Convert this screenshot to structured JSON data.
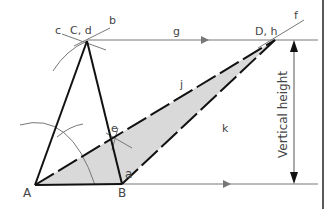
{
  "diagram": {
    "title": "",
    "points": {
      "A": {
        "label": "A",
        "x": 35,
        "y": 185
      },
      "B": {
        "label": "B",
        "x": 122,
        "y": 184
      },
      "C": {
        "label": "C, d",
        "x": 87,
        "y": 41
      },
      "D": {
        "label": "D, h",
        "x": 275,
        "y": 40
      }
    },
    "labels": {
      "a": "a",
      "b": "b",
      "c": "c",
      "e": "e",
      "f": "f",
      "g": "g",
      "j": "j",
      "k": "k",
      "vertical_height": "Vertical height"
    },
    "colors": {
      "stroke": "#111111",
      "construction": "#777777",
      "fill": "#d9d9d9",
      "text": "#444444"
    }
  }
}
